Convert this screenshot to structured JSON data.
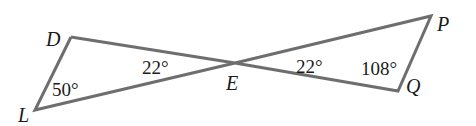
{
  "diagram": {
    "type": "geometry-figure",
    "line_color": "#6e6e6e",
    "points": {
      "D": {
        "label": "D",
        "x": 71,
        "y": 37
      },
      "L": {
        "label": "L",
        "x": 35,
        "y": 110
      },
      "E": {
        "label": "E",
        "x": 235,
        "y": 63
      },
      "P": {
        "label": "P",
        "x": 431,
        "y": 16
      },
      "Q": {
        "label": "Q",
        "x": 398,
        "y": 91
      }
    },
    "segments": [
      [
        "D",
        "L"
      ],
      [
        "D",
        "E"
      ],
      [
        "L",
        "E"
      ],
      [
        "E",
        "P"
      ],
      [
        "E",
        "Q"
      ],
      [
        "P",
        "Q"
      ]
    ],
    "angles": {
      "angle_L": "50°",
      "angle_DEL": "22°",
      "angle_PEQ": "22°",
      "angle_Q": "108°"
    }
  }
}
